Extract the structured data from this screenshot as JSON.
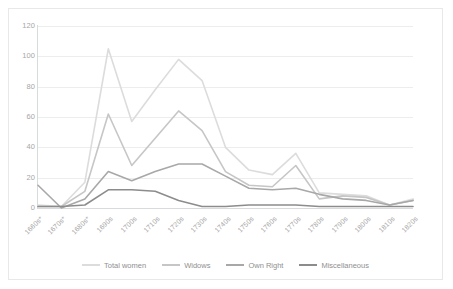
{
  "chart_data": {
    "type": "line",
    "title": "",
    "xlabel": "",
    "ylabel": "",
    "ylim": [
      0,
      120
    ],
    "yticks": [
      0,
      20,
      40,
      60,
      80,
      100,
      120
    ],
    "grid": true,
    "legend_position": "bottom",
    "categories": [
      "1660s*",
      "1670s*",
      "1680s*",
      "1690s",
      "1700s",
      "1710s",
      "1720s",
      "1730s",
      "1740s",
      "1750s",
      "1760s",
      "1770s",
      "1780s",
      "1790s",
      "1800s",
      "1810s",
      "1820s"
    ],
    "series": [
      {
        "name": "Total women",
        "color": "#dcdcdc",
        "values": [
          2,
          1,
          17,
          105,
          57,
          78,
          98,
          84,
          40,
          25,
          22,
          36,
          10,
          9,
          8,
          2,
          6
        ]
      },
      {
        "name": "Widows",
        "color": "#c6c6c6",
        "values": [
          1,
          1,
          11,
          62,
          28,
          46,
          64,
          51,
          24,
          15,
          14,
          28,
          6,
          8,
          7,
          2,
          5
        ]
      },
      {
        "name": "Own Right",
        "color": "#a8a8a8",
        "values": [
          15,
          0,
          6,
          24,
          18,
          24,
          29,
          29,
          21,
          13,
          12,
          13,
          9,
          6,
          5,
          2,
          5
        ]
      },
      {
        "name": "Miscellaneous",
        "color": "#8c8c8c",
        "values": [
          1,
          1,
          2,
          12,
          12,
          11,
          5,
          1,
          1,
          2,
          2,
          2,
          1,
          1,
          1,
          1,
          1
        ]
      }
    ]
  },
  "legend": {
    "items": [
      {
        "label": "Total women"
      },
      {
        "label": "Widows"
      },
      {
        "label": "Own Right"
      },
      {
        "label": "Miscellaneous"
      }
    ]
  }
}
